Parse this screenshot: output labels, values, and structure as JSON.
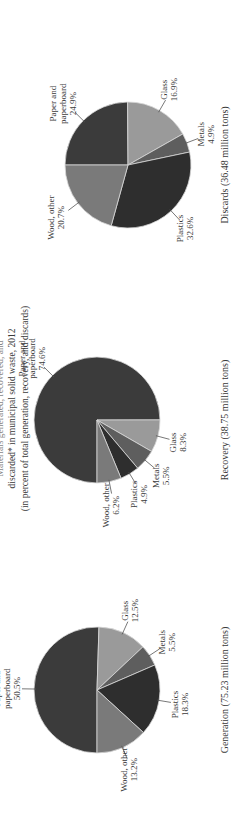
{
  "title": {
    "line0": "Materials generated, recovered, and",
    "line1": "discarded* in municipal solid waste, 2012",
    "line2": "(in percent of total generation, recovery, and discards)"
  },
  "charts": [
    {
      "caption": "Generation (75.23 million tons)"
    },
    {
      "caption": "Recovery (38.75 million tons)"
    },
    {
      "caption": "Discards (36.48 million tons)"
    }
  ],
  "colors": {
    "paper": "#3b3b3b",
    "glass": "#9a9a9a",
    "metals": "#5e5e5e",
    "plastics": "#2e2e2e",
    "wood": "#7a7a7a"
  },
  "chart_data": [
    {
      "type": "pie",
      "title": "Generation (75.23 million tons)",
      "categories": [
        "Paper and paperboard",
        "Glass",
        "Metals",
        "Plastics",
        "Wood, other"
      ],
      "values": [
        50.5,
        12.5,
        5.5,
        18.3,
        13.2
      ],
      "unit": "%"
    },
    {
      "type": "pie",
      "title": "Recovery (38.75 million tons)",
      "categories": [
        "Paper and paperboard",
        "Glass",
        "Metals",
        "Plastics",
        "Wood, other"
      ],
      "values": [
        74.6,
        8.3,
        5.5,
        4.9,
        6.2
      ],
      "unit": "%"
    },
    {
      "type": "pie",
      "title": "Discards (36.48 million tons)",
      "categories": [
        "Paper and paperboard",
        "Glass",
        "Metals",
        "Plastics",
        "Wood, other"
      ],
      "values": [
        24.9,
        16.9,
        4.9,
        32.6,
        20.7
      ],
      "unit": "%"
    }
  ]
}
